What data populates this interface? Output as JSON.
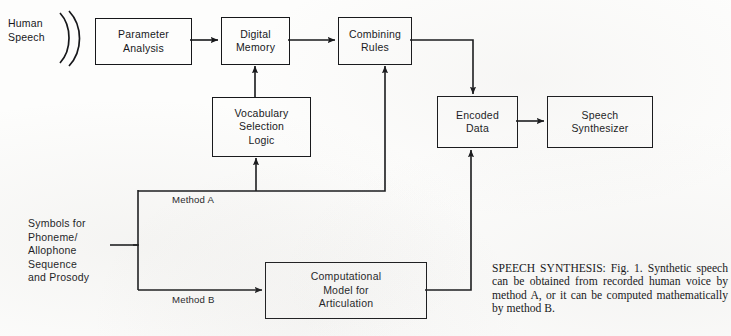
{
  "figure": {
    "kind": "block-diagram",
    "title_in_caption": "SPEECH SYNTHESIS: Fig. 1.",
    "caption": "SPEECH SYNTHESIS: Fig. 1. Synthetic speech can be obtained from recorded human voice by method A, or it can be computed mathematically by method B."
  },
  "inputs": {
    "human_speech": "Human\nSpeech",
    "symbols": "Symbols for\nPhoneme/\nAllophone\nSequence\nand Prosody"
  },
  "nodes": {
    "parameter_analysis": "Parameter\nAnalysis",
    "digital_memory": "Digital\nMemory",
    "combining_rules": "Combining\nRules",
    "vocabulary_selection_logic": "Vocabulary\nSelection\nLogic",
    "encoded_data": "Encoded\nData",
    "speech_synthesizer": "Speech\nSynthesizer",
    "computational_model": "Computational\nModel for\nArticulation"
  },
  "edge_labels": {
    "method_a": "Method A",
    "method_b": "Method B"
  },
  "colors": {
    "ink": "#16171a",
    "paper": "#fdfdfc"
  }
}
